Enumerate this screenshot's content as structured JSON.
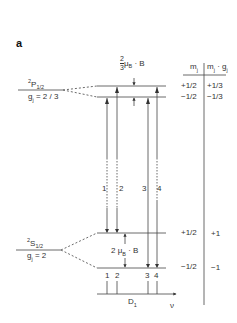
{
  "panel_label": "a",
  "upper_state": {
    "term": "P",
    "mult": "2",
    "j": "1/2",
    "g_label": "g",
    "g_sub": "j",
    "g_value": " = 2 / 3"
  },
  "lower_state": {
    "term": "S",
    "mult": "2",
    "j": "1/2",
    "g_label": "g",
    "g_sub": "j",
    "g_value": " = 2"
  },
  "upper_splitting": {
    "frac_num": "2",
    "frac_den": "3",
    "mu": "μ",
    "mu_sub": "B",
    "rest": " · B"
  },
  "lower_splitting": {
    "prefix": "2 ",
    "mu": "μ",
    "mu_sub": "B",
    "rest": " · B"
  },
  "table": {
    "col1_header": "m",
    "col1_sub": "j",
    "col2_header_a": "m",
    "col2_sub_a": "j",
    "col2_header_b": " · g",
    "col2_sub_b": "j",
    "rows": [
      {
        "mj": "+1/2",
        "mjgj": "+1/3"
      },
      {
        "mj": "−1/2",
        "mjgj": "−1/3"
      },
      {
        "mj": "+1/2",
        "mjgj": "+1"
      },
      {
        "mj": "−1/2",
        "mjgj": "−1"
      }
    ]
  },
  "transitions": [
    "1",
    "2",
    "3",
    "4"
  ],
  "spectrum": {
    "lines": [
      "1",
      "2",
      "3",
      "4"
    ],
    "label": "D",
    "label_sub": "1",
    "axis": "ν"
  }
}
